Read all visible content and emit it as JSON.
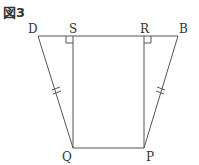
{
  "figure": {
    "title": "図3",
    "labels": {
      "D": "D",
      "S": "S",
      "R": "R",
      "B": "B",
      "Q": "Q",
      "P": "P"
    },
    "colors": {
      "line": "#555555",
      "text": "#333333"
    }
  }
}
